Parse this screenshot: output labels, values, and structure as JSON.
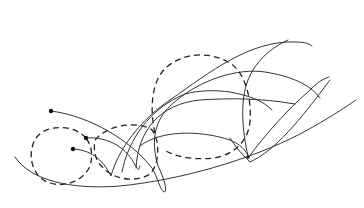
{
  "figure": {
    "stroke_color": "#333333",
    "dash_color": "#222222",
    "background": "#ffffff",
    "start_points": [
      {
        "x": 51,
        "y": 111
      },
      {
        "x": 86,
        "y": 138
      },
      {
        "x": 73,
        "y": 149
      }
    ],
    "dashed_circles": [
      {
        "cx": 62,
        "cy": 162,
        "r": 30
      },
      {
        "cx": 125,
        "cy": 160,
        "r": 32
      },
      {
        "cx": 206,
        "cy": 108,
        "r": 52
      }
    ]
  }
}
